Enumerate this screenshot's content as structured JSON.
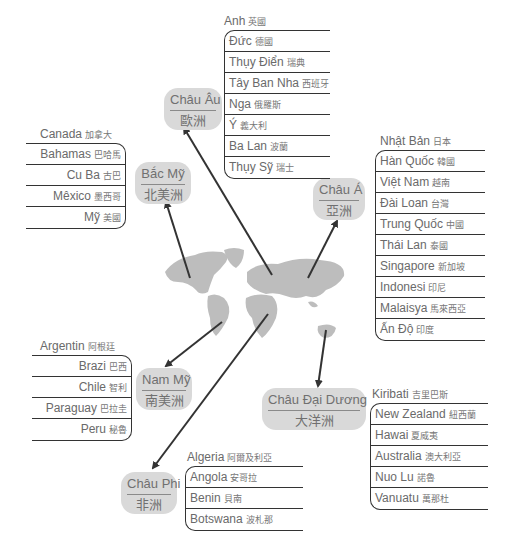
{
  "continents": {
    "europe": {
      "vn": "Châu Âu",
      "cn": "歐洲"
    },
    "namerica": {
      "vn": "Bắc Mỹ",
      "cn": "北美洲"
    },
    "asia": {
      "vn": "Châu Á",
      "cn": "亞洲"
    },
    "samerica": {
      "vn": "Nam Mỹ",
      "cn": "南美洲"
    },
    "oceania": {
      "vn": "Châu Đại Dương",
      "cn": "大洋洲"
    },
    "africa": {
      "vn": "Châu Phi",
      "cn": "非洲"
    }
  },
  "countries": {
    "europe": {
      "head": {
        "vn": "Anh",
        "cn": "英國"
      },
      "items": [
        {
          "vn": "Đức",
          "cn": "德國"
        },
        {
          "vn": "Thụy Điển",
          "cn": "瑞典"
        },
        {
          "vn": "Tây Ban Nha",
          "cn": "西班牙"
        },
        {
          "vn": "Nga",
          "cn": "俄羅斯"
        },
        {
          "vn": "Ý",
          "cn": "義大利"
        },
        {
          "vn": "Ba Lan",
          "cn": "波蘭"
        },
        {
          "vn": "Thụy Sỹ",
          "cn": "瑞士"
        }
      ]
    },
    "namerica": {
      "head": {
        "vn": "Canada",
        "cn": "加拿大"
      },
      "items": [
        {
          "vn": "Bahamas",
          "cn": "巴哈馬"
        },
        {
          "vn": "Cu Ba",
          "cn": "古巴"
        },
        {
          "vn": "Mêxico",
          "cn": "墨西哥"
        },
        {
          "vn": "Mỹ",
          "cn": "美國"
        }
      ]
    },
    "asia": {
      "head": {
        "vn": "Nhật Bản",
        "cn": "日本"
      },
      "items": [
        {
          "vn": "Hàn Quốc",
          "cn": "韓國"
        },
        {
          "vn": "Việt Nam",
          "cn": "越南"
        },
        {
          "vn": "Đài Loan",
          "cn": "台灣"
        },
        {
          "vn": "Trung Quốc",
          "cn": "中國"
        },
        {
          "vn": "Thái Lan",
          "cn": "泰國"
        },
        {
          "vn": "Singapore",
          "cn": "新加坡"
        },
        {
          "vn": "Indonesi",
          "cn": "印尼"
        },
        {
          "vn": "Malaisya",
          "cn": "馬來西亞"
        },
        {
          "vn": "Ấn Độ",
          "cn": "印度"
        }
      ]
    },
    "samerica": {
      "head": {
        "vn": "Argentin",
        "cn": "阿根廷"
      },
      "items": [
        {
          "vn": "Brazi",
          "cn": "巴西"
        },
        {
          "vn": "Chile",
          "cn": "智利"
        },
        {
          "vn": "Paraguay",
          "cn": "巴拉圭"
        },
        {
          "vn": "Peru",
          "cn": "秘魯"
        }
      ]
    },
    "oceania": {
      "head": {
        "vn": "Kiribati",
        "cn": "吉里巴斯"
      },
      "items": [
        {
          "vn": "New Zealand",
          "cn": "紐西蘭"
        },
        {
          "vn": "Hawai",
          "cn": "夏威夷"
        },
        {
          "vn": "Australia",
          "cn": "澳大利亞"
        },
        {
          "vn": "Nuo Lu",
          "cn": "諾魯"
        },
        {
          "vn": "Vanuatu",
          "cn": "萬那杜"
        }
      ]
    },
    "africa": {
      "head": {
        "vn": "Algeria",
        "cn": "阿爾及利亞"
      },
      "items": [
        {
          "vn": "Angola",
          "cn": "安哥拉"
        },
        {
          "vn": "Benin",
          "cn": "貝南"
        },
        {
          "vn": "Botswana",
          "cn": "波札那"
        }
      ]
    }
  },
  "colors": {
    "bubble": "#d9d9d9",
    "map": "#bdbdbd",
    "line": "#333333",
    "text": "#6a6a6a"
  }
}
